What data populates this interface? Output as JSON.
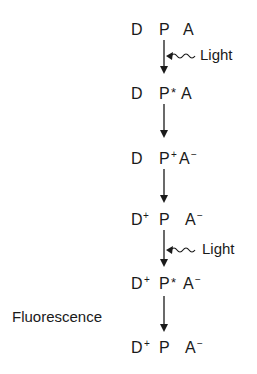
{
  "diagram": {
    "states": [
      {
        "d": "D",
        "d_sup": "",
        "p": "P",
        "p_sup": "",
        "a": "A",
        "a_sup": ""
      },
      {
        "d": "D",
        "d_sup": "",
        "p": "P",
        "p_sup": "*",
        "a": "A",
        "a_sup": ""
      },
      {
        "d": "D",
        "d_sup": "",
        "p": "P",
        "p_sup": "+",
        "a": "A",
        "a_sup": "−"
      },
      {
        "d": "D",
        "d_sup": "+",
        "p": "P",
        "p_sup": "",
        "a": "A",
        "a_sup": "−"
      },
      {
        "d": "D",
        "d_sup": "+",
        "p": "P",
        "p_sup": "*",
        "a": "A",
        "a_sup": "−"
      },
      {
        "d": "D",
        "d_sup": "+",
        "p": "P",
        "p_sup": "",
        "a": "A",
        "a_sup": "−"
      }
    ],
    "labels": {
      "light_1": "Light",
      "light_2": "Light",
      "fluorescence": "Fluorescence"
    },
    "colors": {
      "ink": "#1a1a1a",
      "background": "#ffffff"
    }
  }
}
